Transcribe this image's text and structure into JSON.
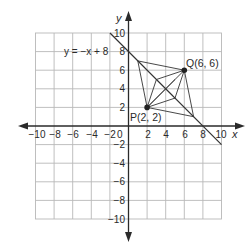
{
  "diagram": {
    "type": "coordinate-plane",
    "axes": {
      "x_label": "x",
      "y_label": "y",
      "x_range": [
        -10,
        10
      ],
      "y_range": [
        -10,
        10
      ],
      "tick_step": 2,
      "x_ticks": [
        "−10",
        "−8",
        "−6",
        "−4",
        "−2",
        "2",
        "4",
        "6",
        "8",
        "10"
      ],
      "y_ticks_pos": [
        "10",
        "8",
        "6",
        "4",
        "2"
      ],
      "y_ticks_neg": [
        "−2",
        "−4",
        "−6",
        "−8",
        "−10"
      ],
      "origin_label": "0"
    },
    "line": {
      "equation_label": "y = −x + 8",
      "slope": -1,
      "intercept": 8
    },
    "points": [
      {
        "name": "P",
        "x": 2,
        "y": 2,
        "label": "P(2, 2)"
      },
      {
        "name": "Q",
        "x": 6,
        "y": 6,
        "label": "Q(6, 6)"
      }
    ],
    "colors": {
      "grid": "#b5b5b5",
      "axes": "#2a2a2a",
      "line": "#333333",
      "background": "#ffffff"
    }
  }
}
